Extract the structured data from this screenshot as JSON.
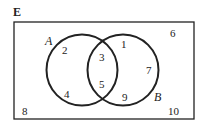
{
  "diagram": {
    "type": "venn",
    "universal_label": "E",
    "sets": [
      {
        "name": "A",
        "label": "A"
      },
      {
        "name": "B",
        "label": "B"
      }
    ],
    "regions": {
      "only_A": [
        "2",
        "4"
      ],
      "A_and_B": [
        "3",
        "5"
      ],
      "only_B": [
        "1",
        "7",
        "9"
      ],
      "neither": [
        "6",
        "8",
        "10"
      ]
    },
    "elements": {
      "e1": "1",
      "e2": "2",
      "e3": "3",
      "e4": "4",
      "e5": "5",
      "e6": "6",
      "e7": "7",
      "e8": "8",
      "e9": "9",
      "e10": "10"
    },
    "colors": {
      "stroke": "#222222",
      "background": "#ffffff"
    }
  }
}
